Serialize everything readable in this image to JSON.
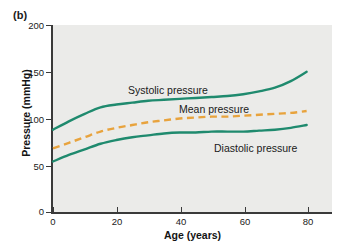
{
  "figure": {
    "panel_label": "(b)"
  },
  "chart_data": {
    "type": "line",
    "title": "",
    "subtitle": "",
    "xlabel": "Age (years)",
    "ylabel": "Pressure (mmHg)",
    "xlim": [
      0,
      88
    ],
    "ylim": [
      0,
      200
    ],
    "xticks": [
      0,
      20,
      40,
      60,
      80
    ],
    "xtick_labels": [
      "0",
      "20",
      "40",
      "60",
      "80"
    ],
    "yticks": [
      0,
      50,
      100,
      150,
      200
    ],
    "ytick_labels": [
      "0",
      "50",
      "100",
      "150",
      "200"
    ],
    "grid": false,
    "legend_position": "inline-annotations",
    "plot_background": "#ebebe9",
    "colors": {
      "systolic": "#1f8a6e",
      "mean": "#e8a33d",
      "diastolic": "#1f8a6e",
      "axis": "#3a3a3a",
      "text": "#1a1a1a"
    },
    "x": [
      0,
      5,
      10,
      15,
      20,
      25,
      30,
      35,
      40,
      45,
      50,
      55,
      60,
      65,
      70,
      75,
      80
    ],
    "series": [
      {
        "name": "Systolic pressure",
        "label": "Systolic pressure",
        "style": "solid",
        "color": "#1f8a6e",
        "values": [
          88,
          97,
          105,
          112,
          115,
          117,
          119,
          120,
          121,
          122,
          123,
          124,
          126,
          129,
          133,
          140,
          150
        ]
      },
      {
        "name": "Mean pressure",
        "label": "Mean pressure",
        "style": "dashed",
        "color": "#e8a33d",
        "values": [
          68,
          74,
          80,
          86,
          90,
          93,
          96,
          98,
          100,
          101,
          102,
          102,
          103,
          104,
          105,
          106,
          108
        ]
      },
      {
        "name": "Diastolic pressure",
        "label": "Diastolic pressure",
        "style": "solid",
        "color": "#1f8a6e",
        "values": [
          54,
          61,
          67,
          73,
          77,
          80,
          82,
          84,
          85,
          85,
          86,
          86,
          86,
          87,
          88,
          90,
          93
        ]
      }
    ],
    "annotations": [
      {
        "text": "Systolic pressure",
        "x": 18,
        "y": 133
      },
      {
        "text": "Mean pressure",
        "x": 40,
        "y": 113
      },
      {
        "text": "Diastolic pressure",
        "x": 55,
        "y": 73
      }
    ]
  }
}
